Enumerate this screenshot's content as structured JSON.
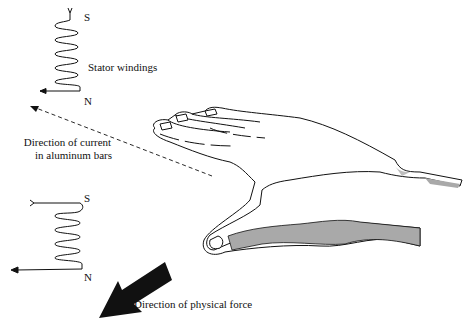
{
  "figure": {
    "top_coil": {
      "south_label": "S",
      "north_label": "N",
      "caption": "Stator windings"
    },
    "current_arrow": {
      "line1": "Direction of current",
      "line2": "in aluminum bars"
    },
    "bottom_coil": {
      "south_label": "S",
      "north_label": "N"
    },
    "force_arrow": {
      "caption": "Direction of physical force"
    },
    "colors": {
      "ink": "#111111",
      "shading": "#a9a9a9",
      "background": "#ffffff"
    }
  }
}
